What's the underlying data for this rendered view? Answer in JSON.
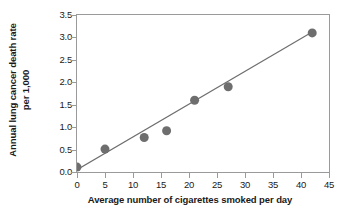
{
  "chart_data": {
    "type": "scatter",
    "title": "",
    "xlabel": "Average number of cigarettes smoked per day",
    "ylabel_lines": [
      "Annual lung cancer death rate",
      "per 1,000"
    ],
    "ylabel": "Annual lung cancer death rate per 1,000",
    "xlim": [
      0,
      45
    ],
    "ylim": [
      0,
      3.5
    ],
    "xticks": [
      "0",
      "5",
      "10",
      "15",
      "20",
      "25",
      "30",
      "35",
      "40",
      "45"
    ],
    "xtick_values": [
      0,
      5,
      10,
      15,
      20,
      25,
      30,
      35,
      40,
      45
    ],
    "yticks": [
      "0.0",
      "0.5",
      "1.0",
      "1.5",
      "2.0",
      "2.5",
      "3.0",
      "3.5"
    ],
    "ytick_values": [
      0.0,
      0.5,
      1.0,
      1.5,
      2.0,
      2.5,
      3.0,
      3.5
    ],
    "grid": false,
    "legend": "none",
    "x": [
      0,
      5,
      12,
      16,
      21,
      27,
      42
    ],
    "y": [
      0.11,
      0.51,
      0.77,
      0.92,
      1.6,
      1.9,
      3.1
    ],
    "points": [
      {
        "x": 0,
        "y": 0.11
      },
      {
        "x": 5,
        "y": 0.51
      },
      {
        "x": 12,
        "y": 0.77
      },
      {
        "x": 16,
        "y": 0.92
      },
      {
        "x": 21,
        "y": 1.6
      },
      {
        "x": 27,
        "y": 1.9
      },
      {
        "x": 42,
        "y": 3.1
      }
    ],
    "trend_line": {
      "type": "linear-fit",
      "x_start": 0,
      "y_start": 0.05,
      "x_end": 42,
      "y_end": 3.12
    },
    "marker_color": "#6e6e6e",
    "line_color": "#6e6e6e",
    "frame_color": "#9a9a9a",
    "background_color": "#ffffff",
    "marker_size_px": 9
  }
}
